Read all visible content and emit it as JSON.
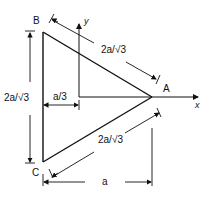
{
  "diagram": {
    "type": "geometry",
    "vertices": {
      "A": "A",
      "B": "B",
      "C": "C"
    },
    "axes": {
      "x": "x",
      "y": "y"
    },
    "dimensions": {
      "side_BA": "2a/√3",
      "side_CA": "2a/√3",
      "side_BC": "2a/√3",
      "offset": "a/3",
      "width": "a"
    },
    "stroke_color": "#111111",
    "background": "#ffffff"
  }
}
